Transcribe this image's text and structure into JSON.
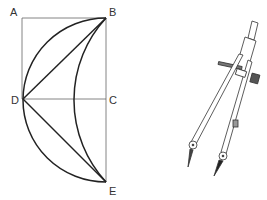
{
  "figure": {
    "points": [
      {
        "id": "A",
        "label": "A"
      },
      {
        "id": "B",
        "label": "B"
      },
      {
        "id": "C",
        "label": "C"
      },
      {
        "id": "D",
        "label": "D"
      },
      {
        "id": "E",
        "label": "E"
      }
    ],
    "segments": [
      "AB",
      "AD",
      "BC",
      "CE",
      "DC",
      "DB",
      "DE"
    ],
    "arcs": [
      "outer semicircle B-D-E centered at C",
      "inner arc B-E"
    ],
    "tool": "compass"
  },
  "colors": {
    "line": "#2a2a2a",
    "thin_line": "#555555",
    "background": "#ffffff"
  }
}
